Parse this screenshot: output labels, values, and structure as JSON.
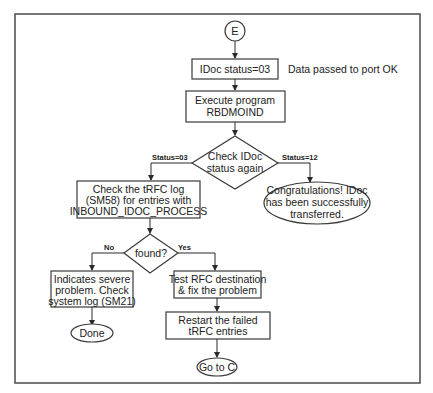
{
  "diagram": {
    "type": "flowchart",
    "start_connector": "E",
    "nodes": {
      "idoc_status": {
        "shape": "process",
        "lines": [
          "IDoc status=03"
        ]
      },
      "idoc_status_note": {
        "shape": "annotation",
        "lines": [
          "Data passed to port OK"
        ]
      },
      "execute_program": {
        "shape": "process",
        "lines": [
          "Execute program",
          "RBDMOIND"
        ]
      },
      "check_status": {
        "shape": "decision",
        "lines": [
          "Check IDoc",
          "status again"
        ]
      },
      "check_trfc": {
        "shape": "process",
        "lines": [
          "Check the tRFC log",
          "(SM58) for entries with",
          "INBOUND_IDOC_PROCESS"
        ]
      },
      "congrats": {
        "shape": "terminal",
        "lines": [
          "Congratulations! IDoc",
          "has been successfully",
          "transferred."
        ]
      },
      "found": {
        "shape": "decision",
        "lines": [
          "found?"
        ]
      },
      "severe": {
        "shape": "process",
        "lines": [
          "Indicates severe",
          "problem. Check",
          "system log (SM21)"
        ]
      },
      "done": {
        "shape": "terminal",
        "lines": [
          "Done"
        ]
      },
      "test_rfc": {
        "shape": "process",
        "lines": [
          "Test RFC destination",
          "& fix the problem"
        ]
      },
      "restart": {
        "shape": "process",
        "lines": [
          "Restart the failed",
          "tRFC entries"
        ]
      },
      "goto_c": {
        "shape": "terminal",
        "lines": [
          "Go to C"
        ]
      }
    },
    "edge_labels": {
      "status_03": "Status=03",
      "status_12": "Status=12",
      "no": "No",
      "yes": "Yes"
    },
    "edges": [
      {
        "from": "E",
        "to": "idoc_status"
      },
      {
        "from": "idoc_status",
        "to": "execute_program"
      },
      {
        "from": "execute_program",
        "to": "check_status"
      },
      {
        "from": "check_status",
        "to": "check_trfc",
        "label": "Status=03"
      },
      {
        "from": "check_status",
        "to": "congrats",
        "label": "Status=12"
      },
      {
        "from": "check_trfc",
        "to": "found"
      },
      {
        "from": "found",
        "to": "severe",
        "label": "No"
      },
      {
        "from": "found",
        "to": "test_rfc",
        "label": "Yes"
      },
      {
        "from": "severe",
        "to": "done"
      },
      {
        "from": "test_rfc",
        "to": "restart"
      },
      {
        "from": "restart",
        "to": "goto_c"
      }
    ]
  }
}
